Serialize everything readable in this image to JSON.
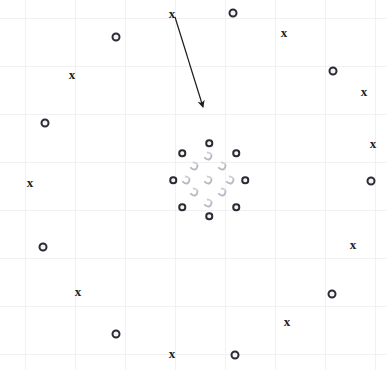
{
  "figure": {
    "title": "",
    "background_color": "#ffffff",
    "grid": {
      "visible": true,
      "color": "#f1f1f4",
      "spacing_px": 50,
      "vertical_lines": [
        25,
        75,
        125,
        175,
        225,
        275,
        325,
        375
      ],
      "horizontal_lines": [
        18,
        66,
        114,
        162,
        210,
        258,
        306,
        354
      ]
    },
    "marker_styles": {
      "circle_label": "o",
      "cross_label": "x",
      "circle_color": "#2b2b33",
      "crescent_color": "#b9b9c2",
      "cross_color": "#1c1c22"
    }
  },
  "chart_data": {
    "type": "scatter",
    "title": "",
    "xlabel": "",
    "ylabel": "",
    "xlim": [
      0,
      387
    ],
    "ylim": [
      0,
      370
    ],
    "grid": true,
    "legend": "none",
    "series": [
      {
        "name": "outer circles",
        "marker": "o",
        "points": [
          [
            116,
            37
          ],
          [
            233,
            13
          ],
          [
            45,
            123
          ],
          [
            333,
            71
          ],
          [
            371,
            181
          ],
          [
            43,
            247
          ],
          [
            332,
            294
          ],
          [
            116,
            334
          ],
          [
            235,
            355
          ]
        ]
      },
      {
        "name": "outer crosses",
        "marker": "x",
        "points": [
          [
            172,
            13
          ],
          [
            284,
            32
          ],
          [
            72,
            74
          ],
          [
            364,
            91
          ],
          [
            373,
            143
          ],
          [
            30,
            182
          ],
          [
            353,
            244
          ],
          [
            78,
            291
          ],
          [
            287,
            321
          ],
          [
            172,
            353
          ]
        ]
      },
      {
        "name": "cluster ring circles",
        "marker": "o",
        "points": [
          [
            209,
            143
          ],
          [
            182,
            153
          ],
          [
            236,
            153
          ],
          [
            173,
            180
          ],
          [
            245,
            180
          ],
          [
            182,
            207
          ],
          [
            236,
            207
          ],
          [
            209,
            216
          ]
        ]
      },
      {
        "name": "cluster inner crescents",
        "marker": "crescent",
        "points": [
          [
            194,
            166
          ],
          [
            222,
            166
          ],
          [
            208,
            156
          ],
          [
            194,
            192
          ],
          [
            222,
            192
          ],
          [
            208,
            180
          ],
          [
            186,
            180
          ],
          [
            230,
            180
          ],
          [
            208,
            203
          ]
        ]
      }
    ],
    "annotations": [
      {
        "type": "arrow",
        "label": "",
        "from": [
          175,
          17
        ],
        "to": [
          203,
          107
        ],
        "color": "#1c1c22"
      }
    ]
  }
}
